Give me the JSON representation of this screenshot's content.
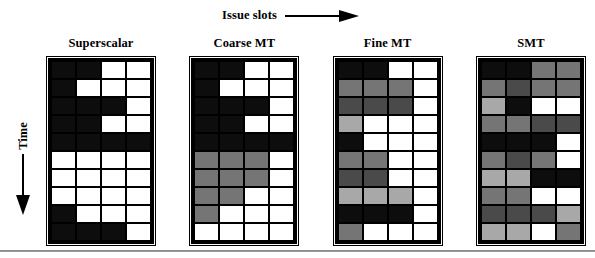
{
  "figure": {
    "x_axis_label": "Issue slots",
    "y_axis_label": "Time",
    "x_arrow_icon": "arrow-right-icon",
    "y_arrow_icon": "arrow-down-icon"
  },
  "palette": {
    "black": "#0d0d0d",
    "dark_gray": "#4a4a4a",
    "mid_gray": "#757575",
    "light_gray": "#a8a8a8",
    "white": "#ffffff",
    "grid_line": "#000000",
    "rule": "#8c8c8c"
  },
  "chart_data": {
    "type": "heatmap",
    "title": "",
    "xlabel": "Issue slots",
    "ylabel": "Time",
    "grid": true,
    "legend_position": "none",
    "rows": 10,
    "columns": 4,
    "color_levels": {
      "black": "#0d0d0d",
      "dark_gray": "#4a4a4a",
      "mid_gray": "#757575",
      "light_gray": "#a8a8a8",
      "white": "#ffffff"
    },
    "panels": [
      {
        "label": "Superscalar",
        "cells": [
          [
            "black",
            "black",
            "white",
            "white"
          ],
          [
            "black",
            "white",
            "white",
            "white"
          ],
          [
            "black",
            "black",
            "black",
            "white"
          ],
          [
            "black",
            "black",
            "white",
            "white"
          ],
          [
            "black",
            "black",
            "black",
            "black"
          ],
          [
            "white",
            "white",
            "white",
            "white"
          ],
          [
            "white",
            "white",
            "white",
            "white"
          ],
          [
            "white",
            "white",
            "white",
            "white"
          ],
          [
            "black",
            "white",
            "white",
            "white"
          ],
          [
            "black",
            "black",
            "black",
            "white"
          ]
        ]
      },
      {
        "label": "Coarse MT",
        "cells": [
          [
            "black",
            "black",
            "white",
            "white"
          ],
          [
            "black",
            "white",
            "white",
            "white"
          ],
          [
            "black",
            "black",
            "black",
            "white"
          ],
          [
            "black",
            "black",
            "white",
            "white"
          ],
          [
            "black",
            "black",
            "black",
            "black"
          ],
          [
            "mid_gray",
            "mid_gray",
            "mid_gray",
            "white"
          ],
          [
            "mid_gray",
            "mid_gray",
            "mid_gray",
            "white"
          ],
          [
            "mid_gray",
            "mid_gray",
            "white",
            "white"
          ],
          [
            "mid_gray",
            "white",
            "white",
            "white"
          ],
          [
            "white",
            "white",
            "white",
            "white"
          ]
        ]
      },
      {
        "label": "Fine MT",
        "cells": [
          [
            "black",
            "black",
            "white",
            "white"
          ],
          [
            "mid_gray",
            "mid_gray",
            "mid_gray",
            "white"
          ],
          [
            "dark_gray",
            "dark_gray",
            "dark_gray",
            "white"
          ],
          [
            "light_gray",
            "white",
            "white",
            "white"
          ],
          [
            "black",
            "white",
            "white",
            "white"
          ],
          [
            "mid_gray",
            "mid_gray",
            "white",
            "white"
          ],
          [
            "dark_gray",
            "dark_gray",
            "white",
            "white"
          ],
          [
            "light_gray",
            "light_gray",
            "light_gray",
            "white"
          ],
          [
            "black",
            "black",
            "black",
            "white"
          ],
          [
            "mid_gray",
            "white",
            "white",
            "white"
          ]
        ]
      },
      {
        "label": "SMT",
        "cells": [
          [
            "black",
            "black",
            "mid_gray",
            "mid_gray"
          ],
          [
            "mid_gray",
            "dark_gray",
            "mid_gray",
            "mid_gray"
          ],
          [
            "light_gray",
            "black",
            "white",
            "white"
          ],
          [
            "mid_gray",
            "mid_gray",
            "dark_gray",
            "dark_gray"
          ],
          [
            "black",
            "black",
            "black",
            "white"
          ],
          [
            "mid_gray",
            "dark_gray",
            "mid_gray",
            "white"
          ],
          [
            "light_gray",
            "light_gray",
            "black",
            "black"
          ],
          [
            "mid_gray",
            "mid_gray",
            "white",
            "white"
          ],
          [
            "dark_gray",
            "dark_gray",
            "dark_gray",
            "light_gray"
          ],
          [
            "light_gray",
            "light_gray",
            "white",
            "mid_gray"
          ]
        ]
      }
    ]
  }
}
